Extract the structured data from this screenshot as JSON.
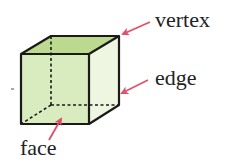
{
  "diagram": {
    "labels": {
      "vertex": "vertex",
      "edge": "edge",
      "face": "face"
    },
    "colors": {
      "top_face": "#bcd98f",
      "front_face": "#d9ecc0",
      "side_face": "#eef6e2",
      "outline": "#1a1a1a",
      "arrow": "#e0506a",
      "text": "#222222"
    }
  }
}
